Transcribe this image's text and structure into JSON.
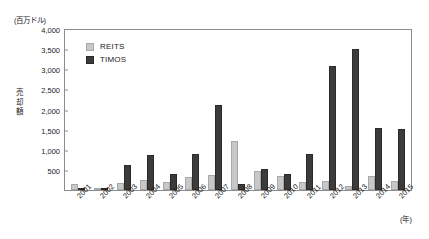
{
  "chart_data": {
    "type": "bar",
    "title": "",
    "subtitle": "",
    "unit_caption": "(百万ドル)",
    "ylabel": "売却額",
    "xlabel": "(年)",
    "grid": false,
    "legend_position": "top-left",
    "ylim": [
      0,
      4000
    ],
    "ytick_step": 500,
    "yticks": [
      "4,000",
      "3,500",
      "3,000",
      "2,500",
      "2,000",
      "1,500",
      "1,000",
      "500",
      ""
    ],
    "ytick_values": [
      4000,
      3500,
      3000,
      2500,
      2000,
      1500,
      1000,
      500,
      0
    ],
    "categories": [
      "2001",
      "2002",
      "2003",
      "2004",
      "2005",
      "2006",
      "2007",
      "2008",
      "2009",
      "2010",
      "2011",
      "2012",
      "2013",
      "2014",
      "2015"
    ],
    "series": [
      {
        "name": "REITS",
        "color": "#c8c8c8",
        "values": [
          130,
          0,
          170,
          230,
          180,
          300,
          350,
          1200,
          460,
          330,
          180,
          200,
          80,
          330,
          200
        ]
      },
      {
        "name": "TIMOS",
        "color": "#3b3b3b",
        "values": [
          0,
          40,
          600,
          850,
          380,
          870,
          2080,
          140,
          500,
          390,
          880,
          3050,
          3480,
          1520,
          1500
        ]
      }
    ]
  },
  "legend": {
    "items": [
      {
        "label": "REITS"
      },
      {
        "label": "TIMOS"
      }
    ]
  }
}
